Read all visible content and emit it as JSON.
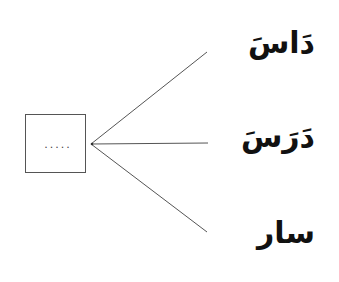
{
  "diagram": {
    "type": "matching-exercise",
    "blank_box": {
      "placeholder": "....."
    },
    "options": [
      {
        "label": "دَاسَ"
      },
      {
        "label": "دَرَسَ"
      },
      {
        "label": "سار"
      }
    ],
    "colors": {
      "line": "#555555",
      "text": "#111111",
      "background": "#ffffff"
    }
  }
}
